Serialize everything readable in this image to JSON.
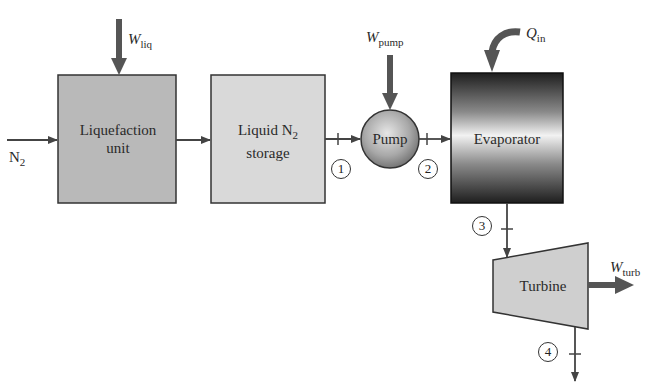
{
  "diagram": {
    "type": "process-flow",
    "components": {
      "liquefaction": {
        "line1": "Liquefaction",
        "line2": "unit",
        "fill": "#b9b9b9"
      },
      "storage": {
        "line1": "Liquid N",
        "sub": "2",
        "line2": "storage",
        "fill": "#d9d9d9"
      },
      "pump": {
        "label": "Pump"
      },
      "evaporator": {
        "label": "Evaporator"
      },
      "turbine": {
        "label": "Turbine",
        "fill": "#cfcfcf"
      }
    },
    "inlet": {
      "main": "N",
      "sub": "2"
    },
    "energy": {
      "w_liq": {
        "main": "W",
        "sub": "liq"
      },
      "w_pump": {
        "main": "W",
        "sub": "pump"
      },
      "q_in": {
        "main": "Q",
        "sub": "in"
      },
      "w_turb": {
        "main": "W",
        "sub": "turb"
      }
    },
    "states": [
      "1",
      "2",
      "3",
      "4"
    ],
    "colors": {
      "line": "#444444",
      "energy_arrow": "#555555"
    }
  }
}
